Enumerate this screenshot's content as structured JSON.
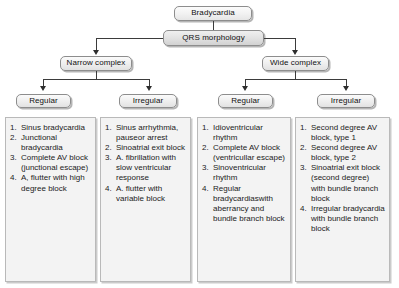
{
  "diagram": {
    "nodes": {
      "root": "Bradycardia",
      "decision": "QRS morphology",
      "narrow": "Narrow complex",
      "wide": "Wide complex",
      "narrow_regular": "Regular",
      "narrow_irregular": "Irregular",
      "wide_regular": "Regular",
      "wide_irregular": "Irregular"
    },
    "panels": [
      {
        "id": "narrow-regular-list",
        "items": [
          "Sinus bradycardia",
          "Junctional bradycardia",
          "Complete AV block (junctional escape)",
          "A, flutter with high degree block"
        ]
      },
      {
        "id": "narrow-irregular-list",
        "items": [
          "Sinus arrhythmia, pauseor arrest",
          "Sinoatrial exit block",
          "A. fibrillation with slow ventricular response",
          "A. flutter with variable block"
        ]
      },
      {
        "id": "wide-regular-list",
        "items": [
          "Idioventricular rhythm",
          "Complete AV block (ventricullar escape)",
          "Sinoventricular rhythm",
          "Regular bradycardiaswith aberrancy and bundle branch block"
        ]
      },
      {
        "id": "wide-irregular-list",
        "items": [
          "Second degree AV block, type 1",
          "Second degree AV block, type 2",
          "Sinoatrial exit block (second degree) with bundle branch block",
          "Irregular bradycardia with bundle branch block"
        ]
      }
    ],
    "colors": {
      "node_border": "#8d8d8d",
      "panel_bg": "#f3f3f3",
      "connector": "#3b3b3b"
    }
  }
}
